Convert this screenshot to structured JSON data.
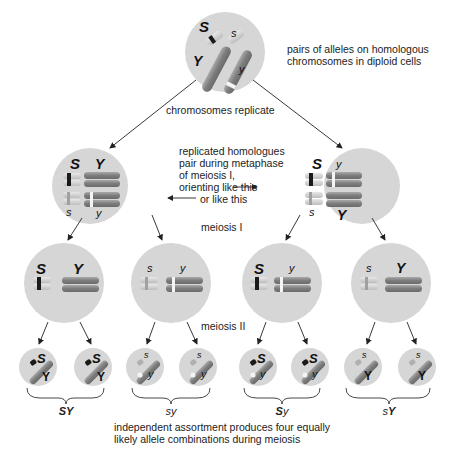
{
  "labels": {
    "top_caption": [
      "pairs of alleles on homologous",
      "chromosomes in diploid cells"
    ],
    "replicate": "chromosomes replicate",
    "metaphase": [
      "replicated homologues",
      "pair during metaphase",
      "of meiosis I,",
      "orienting like this",
      "or like this"
    ],
    "meiosis1": "meiosis I",
    "meiosis2": "meiosis II",
    "bottom_caption": [
      "independent assortment produces four equally",
      "likely allele combinations during meiosis"
    ]
  },
  "alleles": {
    "top": {
      "S": "S",
      "s": "s",
      "Y": "Y",
      "y": "y"
    },
    "left_meta": {
      "a1": "S",
      "a2": "Y",
      "a3": "s",
      "a4": "y"
    },
    "right_meta": {
      "a1": "S",
      "a2": "y",
      "a3": "s",
      "a4": "Y"
    },
    "m1_cells": [
      {
        "a": "S",
        "b": "Y"
      },
      {
        "a": "s",
        "b": "y"
      },
      {
        "a": "S",
        "b": "y"
      },
      {
        "a": "s",
        "b": "Y"
      }
    ],
    "gametes": [
      {
        "a": "S",
        "b": "Y"
      },
      {
        "a": "S",
        "b": "Y"
      },
      {
        "a": "s",
        "b": "y"
      },
      {
        "a": "s",
        "b": "y"
      },
      {
        "a": "S",
        "b": "y"
      },
      {
        "a": "S",
        "b": "y"
      },
      {
        "a": "s",
        "b": "Y"
      },
      {
        "a": "s",
        "b": "Y"
      }
    ]
  },
  "groups": [
    {
      "first": "S",
      "second": "Y",
      "first_bold": true,
      "second_bold": true
    },
    {
      "first": "s",
      "second": "y",
      "first_bold": false,
      "second_bold": false
    },
    {
      "first": "S",
      "second": "y",
      "first_bold": true,
      "second_bold": false
    },
    {
      "first": "s",
      "second": "Y",
      "first_bold": false,
      "second_bold": true
    }
  ],
  "colors": {
    "cell": "#d6d6d6",
    "chromosome_large": "#8a8a8a",
    "chromosome_small": "#c9c9c9",
    "band_dark": "#1a1a1a",
    "band_light": "#f4f4f4"
  }
}
